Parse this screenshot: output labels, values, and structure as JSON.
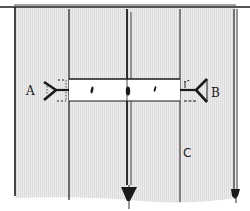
{
  "diagram": {
    "labels": {
      "a": "A",
      "b": "B",
      "c": "C"
    },
    "colors": {
      "background_hatch": "#e6e6e6",
      "line": "#1a1a1a",
      "bar_fill": "#ffffff"
    },
    "elements": {
      "vertical_lines": 5,
      "arrows_down": 2,
      "connectors": [
        "A",
        "B"
      ],
      "bar_marks": 3
    }
  }
}
